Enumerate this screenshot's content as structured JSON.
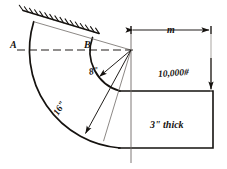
{
  "figure": {
    "type": "engineering-diagram",
    "background_color": "#ffffff",
    "line_color": "#15120f"
  },
  "labels": {
    "point_a": "A",
    "point_b": "B",
    "inner_radius": "8\"",
    "outer_radius": "16\"",
    "dimension_m": "m",
    "load": "10,000#",
    "thickness": "3\" thick"
  },
  "annotations": {
    "support_hatching": "fixed-support-hatch",
    "centerline_horizontal": "dashed-horizontal-centerline",
    "centerline_vertical": "vertical-centerline",
    "load_arrow": "downward-arrow",
    "dimension_arrows": "double-headed-horizontal-arrow"
  },
  "geometry": {
    "center": {
      "x": 131,
      "y": 50
    },
    "inner_radius_px": 41,
    "outer_radius_px": 98,
    "block_top_y": 91,
    "block_bottom_y": 148,
    "block_right_x": 213
  }
}
